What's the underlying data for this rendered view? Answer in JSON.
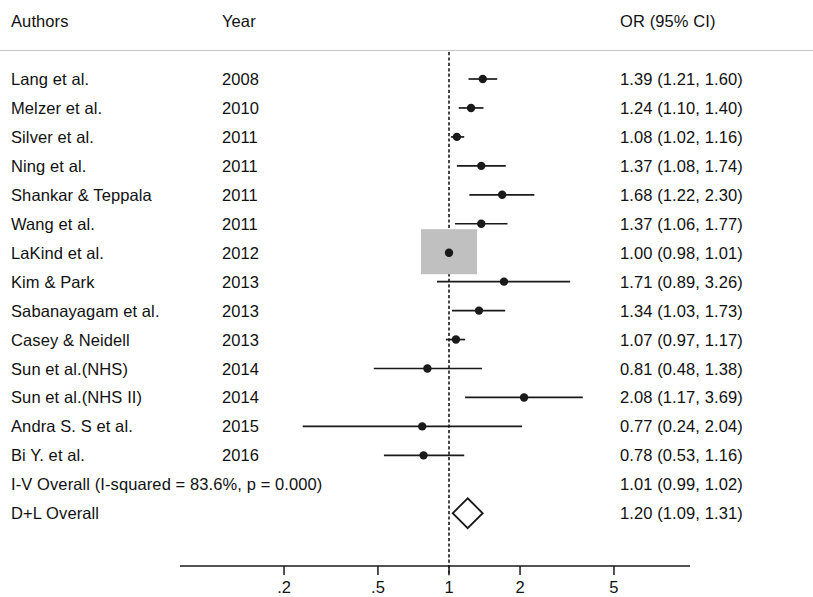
{
  "header": {
    "authors_label": "Authors",
    "year_label": "Year",
    "or_label": "OR (95% CI)"
  },
  "chart_data": {
    "type": "forest",
    "title": "",
    "xlabel": "",
    "ylabel": "",
    "x_scale": "log",
    "xlim": [
      0.2,
      5
    ],
    "grid": false,
    "reference_line": 1,
    "axis_ticks": [
      ".2",
      ".5",
      "1",
      "2",
      "5"
    ],
    "axis_tick_values": [
      0.2,
      0.5,
      1,
      2,
      5
    ],
    "columns": [
      "Authors",
      "Year",
      "OR (95% CI)"
    ],
    "rows": [
      {
        "study": "Lang et al.",
        "year": "2008",
        "or_text": "1.39 (1.21, 1.60)",
        "est": 1.39,
        "lo": 1.21,
        "hi": 1.6,
        "marker": "dot"
      },
      {
        "study": "Melzer et al.",
        "year": "2010",
        "or_text": "1.24 (1.10, 1.40)",
        "est": 1.24,
        "lo": 1.1,
        "hi": 1.4,
        "marker": "dot"
      },
      {
        "study": "Silver et al.",
        "year": "2011",
        "or_text": "1.08 (1.02, 1.16)",
        "est": 1.08,
        "lo": 1.02,
        "hi": 1.16,
        "marker": "dot"
      },
      {
        "study": "Ning et al.",
        "year": "2011",
        "or_text": "1.37 (1.08, 1.74)",
        "est": 1.37,
        "lo": 1.08,
        "hi": 1.74,
        "marker": "dot"
      },
      {
        "study": "Shankar & Teppala",
        "year": "2011",
        "or_text": "1.68 (1.22, 2.30)",
        "est": 1.68,
        "lo": 1.22,
        "hi": 2.3,
        "marker": "dot"
      },
      {
        "study": "Wang et al.",
        "year": "2011",
        "or_text": "1.37 (1.06, 1.77)",
        "est": 1.37,
        "lo": 1.06,
        "hi": 1.77,
        "marker": "dot"
      },
      {
        "study": "LaKind et al.",
        "year": "2012",
        "or_text": "1.00 (0.98, 1.01)",
        "est": 1.0,
        "lo": 0.98,
        "hi": 1.01,
        "marker": "box"
      },
      {
        "study": "Kim & Park",
        "year": "2013",
        "or_text": "1.71 (0.89, 3.26)",
        "est": 1.71,
        "lo": 0.89,
        "hi": 3.26,
        "marker": "dot"
      },
      {
        "study": "Sabanayagam et al.",
        "year": "2013",
        "or_text": "1.34 (1.03, 1.73)",
        "est": 1.34,
        "lo": 1.03,
        "hi": 1.73,
        "marker": "dot"
      },
      {
        "study": "Casey & Neidell",
        "year": "2013",
        "or_text": "1.07 (0.97, 1.17)",
        "est": 1.07,
        "lo": 0.97,
        "hi": 1.17,
        "marker": "dot"
      },
      {
        "study": "Sun et al.(NHS)",
        "year": "2014",
        "or_text": "0.81 (0.48, 1.38)",
        "est": 0.81,
        "lo": 0.48,
        "hi": 1.38,
        "marker": "dot"
      },
      {
        "study": "Sun et al.(NHS II)",
        "year": "2014",
        "or_text": "2.08 (1.17, 3.69)",
        "est": 2.08,
        "lo": 1.17,
        "hi": 3.69,
        "marker": "dot"
      },
      {
        "study": "Andra S. S et al.",
        "year": "2015",
        "or_text": "0.77 (0.24, 2.04)",
        "est": 0.77,
        "lo": 0.24,
        "hi": 2.04,
        "marker": "dot"
      },
      {
        "study": "Bi Y. et al.",
        "year": "2016",
        "or_text": "0.78 (0.53, 1.16)",
        "est": 0.78,
        "lo": 0.53,
        "hi": 1.16,
        "marker": "dot"
      },
      {
        "study": "I-V Overall  (I-squared = 83.6%, p = 0.000)",
        "year": "",
        "or_text": "1.01 (0.99, 1.02)",
        "est": 1.01,
        "lo": 0.99,
        "hi": 1.02,
        "marker": "none",
        "summary": true
      },
      {
        "study": "D+L Overall",
        "year": "",
        "or_text": "1.20 (1.09, 1.31)",
        "est": 1.2,
        "lo": 1.09,
        "hi": 1.31,
        "marker": "diamond",
        "summary": true
      }
    ],
    "heterogeneity": "I-squared = 83.6%, p = 0.000",
    "colors": {
      "text": "#111111",
      "line": "#1a1a1a",
      "weight_box": "#c0c0c0",
      "rule": "#c9c9c9"
    }
  }
}
